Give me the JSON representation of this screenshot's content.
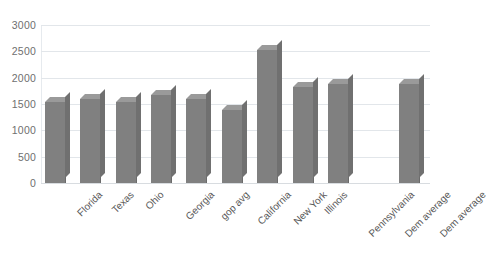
{
  "chart_data": {
    "type": "bar",
    "title": "",
    "subtitle": "",
    "xlabel": "",
    "ylabel": "",
    "grid": true,
    "legend": "none",
    "ylim": [
      0,
      3000
    ],
    "ytick_labels": [
      "3000",
      "2500",
      "2000",
      "1500",
      "1000",
      "500",
      "0"
    ],
    "yticks": [
      3000,
      2500,
      2000,
      1500,
      1000,
      500,
      0
    ],
    "categories": [
      "Florida",
      "Texas",
      "Ohio",
      "Georgia",
      "gop avg",
      "California",
      "New York",
      "Illinois",
      "Pennsylvania",
      "Dem average",
      "Dem average"
    ],
    "values": [
      1540,
      1600,
      1540,
      1670,
      1600,
      1390,
      2530,
      1825,
      1880,
      null,
      1880
    ],
    "bar_color": "#808080",
    "bar_top_color": "#9a9a9a",
    "bar_side_color": "#707070",
    "gridline_color": "#e2e6ea",
    "axis_label_color": "#595959",
    "background": "#ffffff"
  }
}
